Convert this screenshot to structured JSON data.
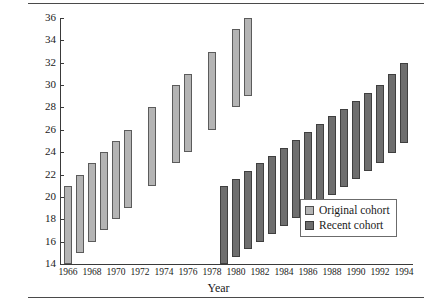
{
  "chart_data": {
    "type": "bar",
    "subtype": "floating-range-bar",
    "title": "",
    "xlabel": "Year",
    "ylabel": "Age",
    "ylim": [
      14,
      36
    ],
    "ytick_step": 2,
    "yticks": [
      14,
      16,
      18,
      20,
      22,
      24,
      26,
      28,
      30,
      32,
      34,
      36
    ],
    "xlim": [
      1965.3,
      1994.7
    ],
    "xticks": [
      1966,
      1968,
      1970,
      1972,
      1974,
      1976,
      1978,
      1980,
      1982,
      1984,
      1986,
      1988,
      1990,
      1992,
      1994
    ],
    "xtick_labels": [
      "1966",
      "1968",
      "1970",
      "1972",
      "1974",
      "1976",
      "1978",
      "1980",
      "1982",
      "1984",
      "1986",
      "1988",
      "1990",
      "1992",
      "1994"
    ],
    "grid": false,
    "legend_position": "lower-right",
    "series": [
      {
        "name": "Original cohort",
        "color": "#b4b4b4",
        "edge_color": "#5b5b5b",
        "bars": [
          {
            "x": 1966,
            "low": 14.0,
            "high": 21.0
          },
          {
            "x": 1967,
            "low": 15.0,
            "high": 22.0
          },
          {
            "x": 1968,
            "low": 16.0,
            "high": 23.0
          },
          {
            "x": 1969,
            "low": 17.0,
            "high": 24.0
          },
          {
            "x": 1970,
            "low": 18.0,
            "high": 25.0
          },
          {
            "x": 1971,
            "low": 19.0,
            "high": 26.0
          },
          {
            "x": 1973,
            "low": 21.0,
            "high": 28.0
          },
          {
            "x": 1975,
            "low": 23.0,
            "high": 30.0
          },
          {
            "x": 1976,
            "low": 24.0,
            "high": 31.0
          },
          {
            "x": 1978,
            "low": 26.0,
            "high": 33.0
          },
          {
            "x": 1980,
            "low": 28.0,
            "high": 35.0
          },
          {
            "x": 1981,
            "low": 29.0,
            "high": 36.0
          }
        ]
      },
      {
        "name": "Recent cohort",
        "color": "#6e6e6e",
        "edge_color": "#3f3f3f",
        "bars": [
          {
            "x": 1979,
            "low": 14.0,
            "high": 21.0
          },
          {
            "x": 1980,
            "low": 14.6,
            "high": 21.6
          },
          {
            "x": 1981,
            "low": 15.3,
            "high": 22.3
          },
          {
            "x": 1982,
            "low": 16.0,
            "high": 23.0
          },
          {
            "x": 1983,
            "low": 16.7,
            "high": 23.7
          },
          {
            "x": 1984,
            "low": 17.4,
            "high": 24.4
          },
          {
            "x": 1985,
            "low": 18.1,
            "high": 25.1
          },
          {
            "x": 1986,
            "low": 18.8,
            "high": 25.8
          },
          {
            "x": 1987,
            "low": 19.5,
            "high": 26.5
          },
          {
            "x": 1988,
            "low": 20.2,
            "high": 27.2
          },
          {
            "x": 1989,
            "low": 20.9,
            "high": 27.9
          },
          {
            "x": 1990,
            "low": 21.6,
            "high": 28.6
          },
          {
            "x": 1991,
            "low": 22.3,
            "high": 29.3
          },
          {
            "x": 1992,
            "low": 23.0,
            "high": 30.0
          },
          {
            "x": 1993,
            "low": 23.9,
            "high": 31.0
          },
          {
            "x": 1994,
            "low": 24.8,
            "high": 32.0
          }
        ]
      }
    ]
  },
  "legend": {
    "items": [
      {
        "label": "Original cohort",
        "key": "original"
      },
      {
        "label": "Recent cohort",
        "key": "recent"
      }
    ]
  }
}
